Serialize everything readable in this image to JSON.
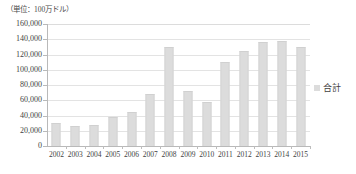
{
  "chart_data": {
    "type": "bar",
    "title": "",
    "unit_caption": "（単位：100万ドル）",
    "categories": [
      "2002",
      "2003",
      "2004",
      "2005",
      "2006",
      "2007",
      "2008",
      "2009",
      "2010",
      "2011",
      "2012",
      "2013",
      "2014",
      "2015"
    ],
    "series": [
      {
        "name": "合計",
        "values": [
          30000,
          26000,
          27000,
          38000,
          45000,
          68000,
          130000,
          72000,
          58000,
          110000,
          125000,
          137000,
          138000,
          130000
        ],
        "color": "#dcdcdc"
      }
    ],
    "xlabel": "",
    "ylabel": "",
    "ylim": [
      0,
      160000
    ],
    "ytick_values": [
      0,
      20000,
      40000,
      60000,
      80000,
      100000,
      120000,
      140000,
      160000
    ],
    "ytick_labels": [
      "0",
      "20,000",
      "40,000",
      "60,000",
      "80,000",
      "100,000",
      "120,000",
      "140,000",
      "160,000"
    ],
    "grid": true,
    "legend_position": "right",
    "legend": [
      {
        "label": "合計",
        "swatch_color": "#dcdcdc"
      }
    ]
  },
  "colors": {
    "bar": "#dcdcdc",
    "gridline": "#e3e3e3",
    "axis": "#b9b9b9",
    "text": "#3f3f3f",
    "background": "#ffffff"
  }
}
